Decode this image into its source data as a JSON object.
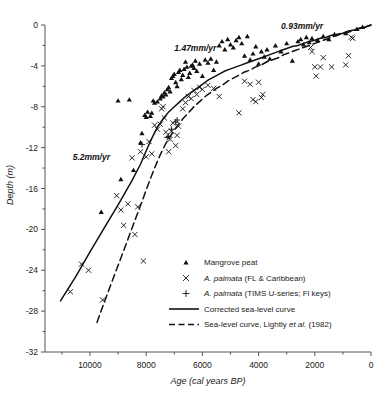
{
  "chart_data": {
    "type": "scatter",
    "title": "",
    "xlabel": "Age (cal years BP)",
    "ylabel": "Depth (m)",
    "xlim": [
      11600,
      0
    ],
    "ylim": [
      -32,
      0
    ],
    "x_ticks": [
      10000,
      8000,
      6000,
      4000,
      2000,
      0
    ],
    "x_tick_labels": [
      "10000",
      "8000",
      "6000",
      "4000",
      "2000",
      "0"
    ],
    "x_minor_step": 1000,
    "y_ticks": [
      0,
      -4,
      -8,
      -12,
      -16,
      -20,
      -24,
      -28,
      -32
    ],
    "y_tick_labels": [
      "0",
      "-4",
      "-8",
      "-12",
      "-16",
      "-20",
      "-24",
      "-28",
      "-32"
    ],
    "y_minor_step": 2,
    "x_axis_reversed": true,
    "grid": false,
    "legend_position": "lower-right-inside",
    "annotations": [
      {
        "text": "0.93mm/yr",
        "x": 2450,
        "y": -0.35
      },
      {
        "text": "1.47mm/yr",
        "x": 6250,
        "y": -2.55
      },
      {
        "text": "5.2mm/yr",
        "x": 9950,
        "y": -13.2
      }
    ],
    "series": [
      {
        "name": "Mangrove peat",
        "marker": "triangle",
        "points": [
          [
            9600,
            -18.3
          ],
          [
            8900,
            -15.1
          ],
          [
            8450,
            -14.2
          ],
          [
            8200,
            -11.5
          ],
          [
            8150,
            -10.6
          ],
          [
            8000,
            -9.0
          ],
          [
            7950,
            -8.5
          ],
          [
            7850,
            -8.9
          ],
          [
            7800,
            -8.6
          ],
          [
            7750,
            -7.4
          ],
          [
            9000,
            -7.4
          ],
          [
            8600,
            -7.3
          ],
          [
            8050,
            -8.8
          ],
          [
            7700,
            -7.6
          ],
          [
            7600,
            -7.5
          ],
          [
            7500,
            -7.2
          ],
          [
            7450,
            -6.9
          ],
          [
            7400,
            -7.0
          ],
          [
            7350,
            -6.6
          ],
          [
            7300,
            -6.8
          ],
          [
            7250,
            -6.3
          ],
          [
            7200,
            -6.1
          ],
          [
            7150,
            -6.5
          ],
          [
            7100,
            -5.2
          ],
          [
            7050,
            -5.0
          ],
          [
            7000,
            -4.8
          ],
          [
            6950,
            -5.6
          ],
          [
            6900,
            -6.0
          ],
          [
            6850,
            -4.6
          ],
          [
            6800,
            -4.4
          ],
          [
            6750,
            -5.3
          ],
          [
            6700,
            -4.9
          ],
          [
            6650,
            -4.3
          ],
          [
            6600,
            -3.6
          ],
          [
            6550,
            -4.1
          ],
          [
            6500,
            -5.1
          ],
          [
            6450,
            -4.7
          ],
          [
            6400,
            -4.0
          ],
          [
            6350,
            -3.9
          ],
          [
            6300,
            -4.2
          ],
          [
            6250,
            -3.5
          ],
          [
            6200,
            -4.5
          ],
          [
            6100,
            -3.8
          ],
          [
            6000,
            -5.0
          ],
          [
            5900,
            -3.4
          ],
          [
            5800,
            -3.7
          ],
          [
            5700,
            -3.3
          ],
          [
            5600,
            -4.4
          ],
          [
            5500,
            -3.6
          ],
          [
            5400,
            -2.0
          ],
          [
            5300,
            -1.6
          ],
          [
            5200,
            -2.4
          ],
          [
            5100,
            -1.4
          ],
          [
            5000,
            -1.9
          ],
          [
            4900,
            -2.2
          ],
          [
            4800,
            -1.5
          ],
          [
            4700,
            -1.2
          ],
          [
            4600,
            -1.8
          ],
          [
            4500,
            -3.0
          ],
          [
            4400,
            -1.1
          ],
          [
            4300,
            -3.4
          ],
          [
            4200,
            -2.8
          ],
          [
            4100,
            -2.1
          ],
          [
            4000,
            -3.8
          ],
          [
            3900,
            -2.6
          ],
          [
            3800,
            -3.1
          ],
          [
            3700,
            -2.4
          ],
          [
            3600,
            -3.3
          ],
          [
            3400,
            -2.0
          ],
          [
            3200,
            -2.6
          ],
          [
            3000,
            -1.8
          ],
          [
            2800,
            -3.5
          ],
          [
            2600,
            -1.6
          ],
          [
            2500,
            -1.4
          ],
          [
            2400,
            -1.9
          ],
          [
            2300,
            -1.2
          ],
          [
            2200,
            -1.7
          ],
          [
            2100,
            -1.3
          ],
          [
            1900,
            -1.5
          ],
          [
            1700,
            -1.1
          ],
          [
            1500,
            -1.4
          ],
          [
            1300,
            -0.9
          ],
          [
            900,
            -0.8
          ],
          [
            500,
            -0.4
          ],
          [
            300,
            -0.2
          ]
        ]
      },
      {
        "name": "A. palmata (FL & Caribbean)",
        "marker": "x",
        "points": [
          [
            10700,
            -26.1
          ],
          [
            10300,
            -23.4
          ],
          [
            10050,
            -24.0
          ],
          [
            9550,
            -26.9
          ],
          [
            9050,
            -16.7
          ],
          [
            8900,
            -18.1
          ],
          [
            8800,
            -19.6
          ],
          [
            8650,
            -17.5
          ],
          [
            8500,
            -13.0
          ],
          [
            8400,
            -20.5
          ],
          [
            8300,
            -17.8
          ],
          [
            8200,
            -12.4
          ],
          [
            8100,
            -23.1
          ],
          [
            8000,
            -12.9
          ],
          [
            7900,
            -11.4
          ],
          [
            7800,
            -12.6
          ],
          [
            7700,
            -9.8
          ],
          [
            7600,
            -10.2
          ],
          [
            7500,
            -9.7
          ],
          [
            7450,
            -8.2
          ],
          [
            7400,
            -8.0
          ],
          [
            7350,
            -9.1
          ],
          [
            7300,
            -10.5
          ],
          [
            7200,
            -12.4
          ],
          [
            7150,
            -11.2
          ],
          [
            7100,
            -10.4
          ],
          [
            7050,
            -9.6
          ],
          [
            6950,
            -11.8
          ],
          [
            6900,
            -10.8
          ],
          [
            6850,
            -9.9
          ],
          [
            6700,
            -8.2
          ],
          [
            6600,
            -7.6
          ],
          [
            6500,
            -7.0
          ],
          [
            6400,
            -7.2
          ],
          [
            6300,
            -6.4
          ],
          [
            6200,
            -6.8
          ],
          [
            6100,
            -6.1
          ],
          [
            6000,
            -6.3
          ],
          [
            5800,
            -5.9
          ],
          [
            5600,
            -6.2
          ],
          [
            5400,
            -7.0
          ],
          [
            4700,
            -8.6
          ],
          [
            4500,
            -5.5
          ],
          [
            4300,
            -5.8
          ],
          [
            4200,
            -7.3
          ],
          [
            4100,
            -7.5
          ],
          [
            4000,
            -5.6
          ],
          [
            3900,
            -7.1
          ],
          [
            3850,
            -6.8
          ],
          [
            2150,
            -2.2
          ],
          [
            2100,
            -2.6
          ],
          [
            2000,
            -4.1
          ],
          [
            1950,
            -5.0
          ],
          [
            1800,
            -4.1
          ],
          [
            1700,
            -3.2
          ],
          [
            1400,
            -4.1
          ],
          [
            900,
            -3.9
          ],
          [
            800,
            -3.0
          ],
          [
            700,
            -1.2
          ],
          [
            650,
            -1.3
          ]
        ]
      },
      {
        "name": "A. palmata (TIMS U-series; Fl keys)",
        "marker": "plus",
        "points": [
          [
            8150,
            -11.7
          ],
          [
            7250,
            -11.0
          ],
          [
            7200,
            -10.9
          ],
          [
            7100,
            -10.2
          ],
          [
            6950,
            -9.5
          ],
          [
            6900,
            -9.3
          ]
        ]
      }
    ],
    "curves": [
      {
        "name": "Corrected sea-level curve",
        "style": "solid",
        "points": [
          [
            11050,
            -27.0
          ],
          [
            10500,
            -24.6
          ],
          [
            10000,
            -22.2
          ],
          [
            9500,
            -19.9
          ],
          [
            9000,
            -17.6
          ],
          [
            8500,
            -15.2
          ],
          [
            8200,
            -13.6
          ],
          [
            8000,
            -12.3
          ],
          [
            7800,
            -11.1
          ],
          [
            7600,
            -10.0
          ],
          [
            7400,
            -9.2
          ],
          [
            7200,
            -8.5
          ],
          [
            7000,
            -8.0
          ],
          [
            6800,
            -7.5
          ],
          [
            6600,
            -7.0
          ],
          [
            6400,
            -6.6
          ],
          [
            6200,
            -6.2
          ],
          [
            6000,
            -5.8
          ],
          [
            5800,
            -5.4
          ],
          [
            5600,
            -5.1
          ],
          [
            5400,
            -4.8
          ],
          [
            5200,
            -4.5
          ],
          [
            5000,
            -4.3
          ],
          [
            4800,
            -4.1
          ],
          [
            4600,
            -3.9
          ],
          [
            4400,
            -3.7
          ],
          [
            4200,
            -3.5
          ],
          [
            4000,
            -3.3
          ],
          [
            3800,
            -3.1
          ],
          [
            3600,
            -2.9
          ],
          [
            3400,
            -2.7
          ],
          [
            3200,
            -2.5
          ],
          [
            3000,
            -2.3
          ],
          [
            2800,
            -2.1
          ],
          [
            2600,
            -2.0
          ],
          [
            2400,
            -1.8
          ],
          [
            2200,
            -1.6
          ],
          [
            2000,
            -1.5
          ],
          [
            1800,
            -1.3
          ],
          [
            1600,
            -1.2
          ],
          [
            1400,
            -1.0
          ],
          [
            1200,
            -0.9
          ],
          [
            1000,
            -0.8
          ],
          [
            800,
            -0.6
          ],
          [
            600,
            -0.5
          ],
          [
            400,
            -0.3
          ],
          [
            200,
            -0.2
          ],
          [
            0,
            0.0
          ]
        ]
      },
      {
        "name": "Sea-level curve, Lightly et al. (1982)",
        "style": "dashed",
        "points": [
          [
            9750,
            -29.1
          ],
          [
            9500,
            -27.2
          ],
          [
            9200,
            -25.0
          ],
          [
            8900,
            -22.8
          ],
          [
            8600,
            -20.6
          ],
          [
            8300,
            -18.4
          ],
          [
            8100,
            -16.9
          ],
          [
            7900,
            -15.4
          ],
          [
            7700,
            -14.0
          ],
          [
            7500,
            -12.7
          ],
          [
            7300,
            -11.6
          ],
          [
            7100,
            -10.7
          ],
          [
            6900,
            -9.9
          ],
          [
            6700,
            -9.2
          ],
          [
            6500,
            -8.6
          ],
          [
            6300,
            -8.0
          ],
          [
            6100,
            -7.5
          ],
          [
            5900,
            -7.0
          ],
          [
            5700,
            -6.6
          ],
          [
            5500,
            -6.2
          ],
          [
            5300,
            -5.9
          ],
          [
            5100,
            -5.5
          ],
          [
            4900,
            -5.2
          ],
          [
            4700,
            -4.9
          ],
          [
            4500,
            -4.6
          ],
          [
            4300,
            -4.4
          ],
          [
            4100,
            -4.1
          ],
          [
            3900,
            -3.9
          ],
          [
            3700,
            -3.6
          ],
          [
            3500,
            -3.4
          ],
          [
            3300,
            -3.2
          ],
          [
            3100,
            -2.9
          ],
          [
            2900,
            -2.7
          ],
          [
            2700,
            -2.5
          ],
          [
            2500,
            -2.3
          ],
          [
            2300,
            -2.1
          ],
          [
            2100,
            -1.9
          ],
          [
            1900,
            -1.7
          ],
          [
            1700,
            -1.5
          ],
          [
            1500,
            -1.3
          ],
          [
            1300,
            -1.1
          ],
          [
            1100,
            -0.9
          ],
          [
            900,
            -0.8
          ],
          [
            700,
            -0.6
          ],
          [
            500,
            -0.4
          ],
          [
            300,
            -0.3
          ],
          [
            100,
            -0.1
          ],
          [
            0,
            0.0
          ]
        ]
      }
    ]
  },
  "legend": {
    "items": [
      {
        "label": "Mangrove peat",
        "marker": "triangle",
        "italic_prefix": ""
      },
      {
        "label": "A. palmata (FL & Caribbean)",
        "marker": "x",
        "italic_prefix": "A. palmata",
        "rest": " (FL & Caribbean)"
      },
      {
        "label": "A. palmata (TIMS U-series; Fl keys)",
        "marker": "x-plus",
        "italic_prefix": "A. palmata",
        "rest": " (TIMS U-series; Fl keys)"
      },
      {
        "label": "Corrected sea-level curve",
        "marker": "solid-line"
      },
      {
        "label": "Sea-level curve, Lightly et al. (1982)",
        "marker": "dashed-line",
        "italic_part": "et al."
      }
    ]
  },
  "colors": {
    "axis": "#555555",
    "data": "#111111",
    "background": "#ffffff"
  }
}
